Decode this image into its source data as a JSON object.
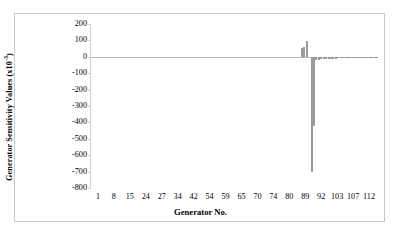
{
  "chart_data": {
    "type": "bar",
    "title": "",
    "xlabel": "Generator No.",
    "ylabel": "Generator Sensitivity Values (x10",
    "ylabel_exponent": "-3",
    "ylabel_suffix": ")",
    "ylim": [
      -800,
      200
    ],
    "yticks": [
      200,
      100,
      0,
      -100,
      -200,
      -300,
      -400,
      -500,
      -600,
      -700,
      -800
    ],
    "ytick_labels": [
      "200",
      "100",
      "0",
      "-100",
      "-200",
      "-300",
      "-400",
      "-500",
      "-600",
      "-700",
      "-800"
    ],
    "xtick_labels": [
      "1",
      "8",
      "15",
      "24",
      "27",
      "34",
      "42",
      "54",
      "59",
      "65",
      "70",
      "74",
      "80",
      "89",
      "92",
      "103",
      "107",
      "112"
    ],
    "grid": false,
    "legend": false,
    "bar_color": "#9a9a9a",
    "x_index_count": 118,
    "values": [
      0,
      0,
      0,
      0,
      0,
      0,
      0,
      0,
      0,
      0,
      0,
      0,
      0,
      0,
      0,
      0,
      0,
      0,
      0,
      0,
      0,
      0,
      0,
      0,
      0,
      0,
      0,
      0,
      0,
      0,
      0,
      0,
      0,
      0,
      0,
      0,
      0,
      0,
      0,
      0,
      0,
      0,
      0,
      0,
      0,
      0,
      0,
      0,
      0,
      0,
      0,
      0,
      0,
      0,
      0,
      0,
      0,
      0,
      0,
      0,
      0,
      0,
      0,
      0,
      0,
      0,
      0,
      0,
      0,
      0,
      0,
      0,
      0,
      0,
      0,
      0,
      0,
      0,
      0,
      0,
      0,
      0,
      0,
      0,
      0,
      0,
      55,
      60,
      95,
      0,
      -700,
      -420,
      -20,
      -18,
      -16,
      -15,
      -14,
      -13,
      -12,
      -12,
      -11,
      -10,
      -10,
      -9,
      -9,
      -8,
      -8,
      -7,
      -7,
      -6,
      -6,
      -5,
      -5,
      -4,
      -4,
      -3,
      -3,
      -2
    ]
  }
}
